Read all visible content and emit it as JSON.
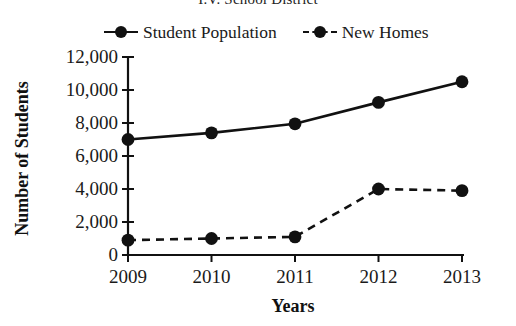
{
  "chart_data": {
    "type": "line",
    "title": "I.V. School District",
    "xlabel": "Years",
    "ylabel": "Number of Students",
    "categories": [
      "2009",
      "2010",
      "2011",
      "2012",
      "2013"
    ],
    "ytick_labels": [
      "12,000",
      "10,000",
      "8,000",
      "6,000",
      "4,000",
      "2,000",
      "0"
    ],
    "ytick_values": [
      12000,
      10000,
      8000,
      6000,
      4000,
      2000,
      0
    ],
    "ylim": [
      0,
      12000
    ],
    "grid": false,
    "legend_position": "top",
    "series": [
      {
        "name": "Student Population",
        "style": "solid",
        "marker": "circle",
        "color": "#111111",
        "values": [
          7000,
          7400,
          7950,
          9250,
          10500
        ]
      },
      {
        "name": "New Homes",
        "style": "dashed",
        "marker": "circle",
        "color": "#111111",
        "values": [
          900,
          1000,
          1100,
          4000,
          3900
        ]
      }
    ]
  }
}
